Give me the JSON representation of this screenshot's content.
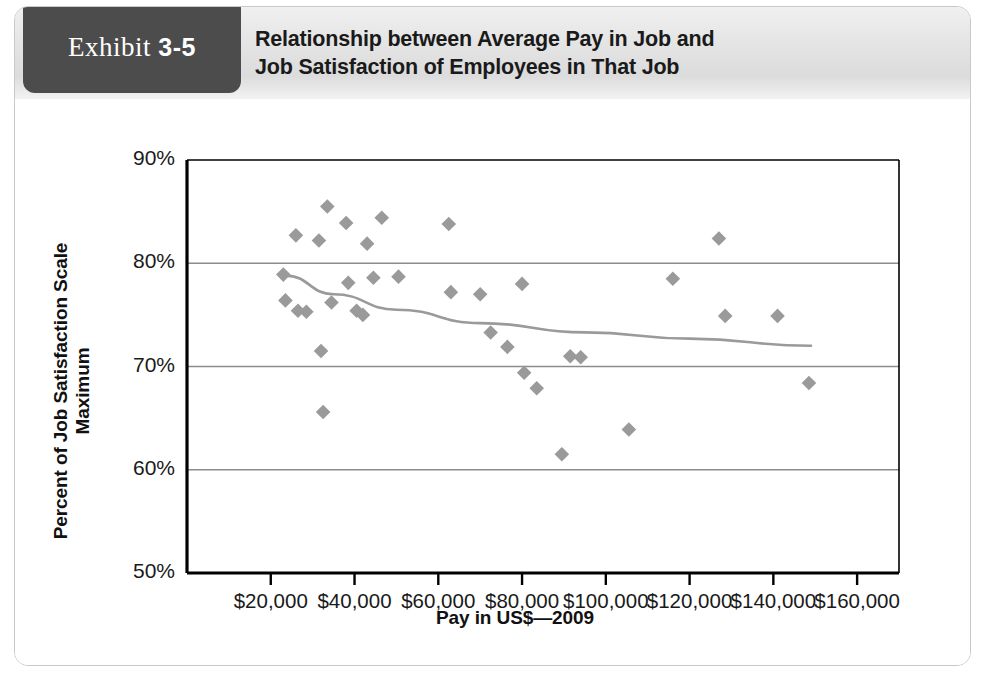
{
  "exhibit": {
    "label_word": "Exhibit",
    "label_number": "3-5",
    "title_line1": "Relationship between Average Pay in Job and",
    "title_line2": "Job Satisfaction of Employees in That Job"
  },
  "colors": {
    "tab_background": "#4c4c4c",
    "header_background": "#e3e3e3",
    "marker": "#9a9a9a",
    "trendline": "#9a9a9a",
    "gridline": "#8c8c8c",
    "axis": "#000000",
    "card_border": "#c9c9c9"
  },
  "chart_data": {
    "type": "scatter",
    "title": "Relationship between Average Pay in Job and Job Satisfaction of Employees in That Job",
    "xlabel": "Pay in US$—2009",
    "ylabel": "Percent of Job Satisfaction Scale Maximum",
    "xlim": [
      0,
      170000
    ],
    "ylim": [
      50,
      90
    ],
    "grid": "horizontal",
    "legend": "none",
    "x_tick_labels": [
      "$20,000",
      "$40,000",
      "$60,000",
      "$80,000",
      "$100,000",
      "$120,000",
      "$140,000",
      "$160,000"
    ],
    "x_tick_values": [
      20000,
      40000,
      60000,
      80000,
      100000,
      120000,
      140000,
      160000
    ],
    "y_tick_labels": [
      "90%",
      "80%",
      "70%",
      "60%",
      "50%"
    ],
    "y_tick_values": [
      90,
      80,
      70,
      60,
      50
    ],
    "series": [
      {
        "name": "Jobs",
        "marker": "diamond",
        "points": [
          {
            "x": 23000,
            "y": 78.9
          },
          {
            "x": 23500,
            "y": 76.4
          },
          {
            "x": 26000,
            "y": 82.7
          },
          {
            "x": 26500,
            "y": 75.4
          },
          {
            "x": 28500,
            "y": 75.3
          },
          {
            "x": 31500,
            "y": 82.2
          },
          {
            "x": 32000,
            "y": 71.5
          },
          {
            "x": 32500,
            "y": 65.6
          },
          {
            "x": 33500,
            "y": 85.5
          },
          {
            "x": 34500,
            "y": 76.2
          },
          {
            "x": 38000,
            "y": 83.9
          },
          {
            "x": 38500,
            "y": 78.1
          },
          {
            "x": 40500,
            "y": 75.4
          },
          {
            "x": 42000,
            "y": 75.0
          },
          {
            "x": 43000,
            "y": 81.9
          },
          {
            "x": 44500,
            "y": 78.6
          },
          {
            "x": 46500,
            "y": 84.4
          },
          {
            "x": 50500,
            "y": 78.7
          },
          {
            "x": 62500,
            "y": 83.8
          },
          {
            "x": 63000,
            "y": 77.2
          },
          {
            "x": 70000,
            "y": 77.0
          },
          {
            "x": 72500,
            "y": 73.3
          },
          {
            "x": 76500,
            "y": 71.9
          },
          {
            "x": 80000,
            "y": 78.0
          },
          {
            "x": 80500,
            "y": 69.4
          },
          {
            "x": 83500,
            "y": 67.9
          },
          {
            "x": 89500,
            "y": 61.5
          },
          {
            "x": 91500,
            "y": 71.0
          },
          {
            "x": 94000,
            "y": 70.9
          },
          {
            "x": 105500,
            "y": 63.9
          },
          {
            "x": 116000,
            "y": 78.5
          },
          {
            "x": 127000,
            "y": 82.4
          },
          {
            "x": 128500,
            "y": 74.9
          },
          {
            "x": 141000,
            "y": 74.9
          },
          {
            "x": 148500,
            "y": 68.4
          }
        ]
      }
    ],
    "trendline": {
      "name": "fitted curve",
      "description": "gently declining curve from about 79% at $23,000 to about 72% at $149,000",
      "points": [
        {
          "x": 23500,
          "y": 78.8
        },
        {
          "x": 35000,
          "y": 77.0
        },
        {
          "x": 50000,
          "y": 75.5
        },
        {
          "x": 70000,
          "y": 74.2
        },
        {
          "x": 95000,
          "y": 73.3
        },
        {
          "x": 120000,
          "y": 72.7
        },
        {
          "x": 149000,
          "y": 72.0
        }
      ]
    }
  }
}
